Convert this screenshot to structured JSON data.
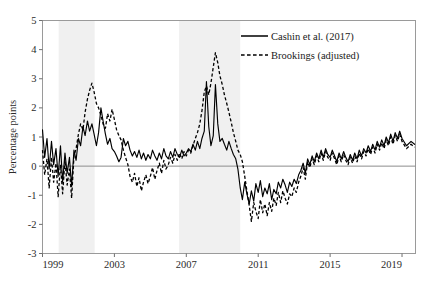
{
  "chart_data": {
    "type": "line",
    "title": "",
    "xlabel": "",
    "ylabel": "Percentage points",
    "xlim": [
      1999.0,
      2019.75
    ],
    "ylim": [
      -3,
      5
    ],
    "grid": false,
    "legend_position": "top-right",
    "y_ticks": [
      5,
      4,
      3,
      2,
      1,
      0,
      -1,
      -2,
      -3
    ],
    "y_tick_labels": [
      "5",
      "4",
      "3",
      "2",
      "1",
      "0",
      "-1",
      "-2",
      "-3"
    ],
    "x_ticks": [
      1999,
      2003,
      2007,
      2011,
      2015,
      2019
    ],
    "x_tick_labels": [
      "1999",
      "2003",
      "2007",
      "2011",
      "2015",
      "2019"
    ],
    "zero_line": 0,
    "shaded_regions": [
      {
        "label": "recession-band-2001",
        "start": 1999.9,
        "end": 2001.9
      },
      {
        "label": "recession-band-2008",
        "start": 2006.6,
        "end": 2010.0
      }
    ],
    "series": [
      {
        "name": "Cashin et al. (2017)",
        "style": "solid",
        "x": [
          1999.0,
          1999.12,
          1999.25,
          1999.37,
          1999.5,
          1999.62,
          1999.75,
          1999.87,
          2000.0,
          2000.12,
          2000.25,
          2000.37,
          2000.5,
          2000.62,
          2000.75,
          2000.87,
          2001.0,
          2001.12,
          2001.25,
          2001.37,
          2001.5,
          2001.62,
          2001.75,
          2001.87,
          2002.0,
          2002.12,
          2002.25,
          2002.37,
          2002.5,
          2002.62,
          2002.75,
          2002.87,
          2003.0,
          2003.12,
          2003.25,
          2003.37,
          2003.5,
          2003.62,
          2003.75,
          2003.87,
          2004.0,
          2004.12,
          2004.25,
          2004.37,
          2004.5,
          2004.62,
          2004.75,
          2004.87,
          2005.0,
          2005.12,
          2005.25,
          2005.37,
          2005.5,
          2005.62,
          2005.75,
          2005.87,
          2006.0,
          2006.12,
          2006.25,
          2006.37,
          2006.5,
          2006.62,
          2006.75,
          2006.87,
          2007.0,
          2007.12,
          2007.25,
          2007.37,
          2007.5,
          2007.62,
          2007.75,
          2007.87,
          2008.0,
          2008.12,
          2008.25,
          2008.37,
          2008.5,
          2008.62,
          2008.75,
          2008.87,
          2009.0,
          2009.12,
          2009.25,
          2009.37,
          2009.5,
          2009.62,
          2009.75,
          2009.87,
          2010.0,
          2010.12,
          2010.25,
          2010.37,
          2010.5,
          2010.62,
          2010.75,
          2010.87,
          2011.0,
          2011.12,
          2011.25,
          2011.37,
          2011.5,
          2011.62,
          2011.75,
          2011.87,
          2012.0,
          2012.12,
          2012.25,
          2012.37,
          2012.5,
          2012.62,
          2012.75,
          2012.87,
          2013.0,
          2013.12,
          2013.25,
          2013.37,
          2013.5,
          2013.62,
          2013.75,
          2013.87,
          2014.0,
          2014.12,
          2014.25,
          2014.37,
          2014.5,
          2014.62,
          2014.75,
          2014.87,
          2015.0,
          2015.12,
          2015.25,
          2015.37,
          2015.5,
          2015.62,
          2015.75,
          2015.87,
          2016.0,
          2016.12,
          2016.25,
          2016.37,
          2016.5,
          2016.62,
          2016.75,
          2016.87,
          2017.0,
          2017.12,
          2017.25,
          2017.37,
          2017.5,
          2017.62,
          2017.75,
          2017.87,
          2018.0,
          2018.12,
          2018.25,
          2018.37,
          2018.5,
          2018.62,
          2018.75,
          2018.87,
          2019.0,
          2019.25,
          2019.5,
          2019.7
        ],
        "y": [
          1.25,
          0.3,
          0.95,
          -0.1,
          0.85,
          0.05,
          0.6,
          -0.35,
          0.7,
          -0.55,
          0.45,
          -0.25,
          0.3,
          -0.7,
          0.55,
          0.2,
          0.95,
          0.7,
          1.35,
          1.05,
          1.55,
          1.2,
          1.45,
          1.1,
          0.7,
          1.15,
          2.0,
          1.55,
          1.1,
          0.75,
          0.95,
          0.6,
          0.5,
          0.35,
          0.15,
          0.3,
          0.95,
          0.7,
          0.85,
          0.55,
          0.35,
          0.5,
          0.3,
          0.55,
          0.25,
          0.45,
          0.2,
          0.4,
          0.25,
          0.55,
          0.35,
          0.2,
          0.45,
          0.25,
          0.6,
          0.35,
          0.25,
          0.5,
          0.3,
          0.6,
          0.4,
          0.3,
          0.55,
          0.35,
          0.45,
          0.6,
          0.5,
          0.75,
          0.55,
          0.85,
          0.6,
          0.95,
          1.2,
          2.9,
          1.35,
          0.7,
          1.05,
          2.8,
          1.45,
          0.85,
          0.95,
          0.75,
          0.55,
          0.85,
          0.6,
          0.4,
          0.25,
          -0.1,
          -0.75,
          -1.15,
          -0.55,
          -0.95,
          -1.3,
          -0.85,
          -1.2,
          -0.6,
          -0.9,
          -0.5,
          -1.05,
          -0.75,
          -0.95,
          -0.6,
          -1.15,
          -0.8,
          -0.95,
          -0.55,
          -0.75,
          -0.45,
          -0.65,
          -0.9,
          -0.55,
          -0.7,
          -0.45,
          -0.6,
          -0.3,
          -0.15,
          0.1,
          -0.25,
          0.25,
          0.05,
          0.35,
          0.15,
          0.45,
          0.25,
          0.55,
          0.3,
          0.6,
          0.4,
          0.3,
          0.55,
          0.35,
          0.15,
          0.45,
          0.25,
          0.5,
          0.3,
          0.15,
          0.4,
          0.2,
          0.45,
          0.25,
          0.55,
          0.35,
          0.6,
          0.45,
          0.7,
          0.5,
          0.75,
          0.55,
          0.85,
          0.65,
          0.9,
          0.7,
          1.0,
          0.8,
          1.1,
          0.85,
          1.15,
          0.95,
          1.2,
          0.95,
          0.7,
          0.85,
          0.75
        ]
      },
      {
        "name": "Brookings (adjusted)",
        "style": "dashed",
        "x": [
          1999.0,
          1999.12,
          1999.25,
          1999.37,
          1999.5,
          1999.62,
          1999.75,
          1999.87,
          2000.0,
          2000.12,
          2000.25,
          2000.37,
          2000.5,
          2000.62,
          2000.75,
          2000.87,
          2001.0,
          2001.12,
          2001.25,
          2001.37,
          2001.5,
          2001.62,
          2001.75,
          2001.87,
          2002.0,
          2002.12,
          2002.25,
          2002.37,
          2002.5,
          2002.62,
          2002.75,
          2002.87,
          2003.0,
          2003.12,
          2003.25,
          2003.37,
          2003.5,
          2003.62,
          2003.75,
          2003.87,
          2004.0,
          2004.12,
          2004.25,
          2004.37,
          2004.5,
          2004.62,
          2004.75,
          2004.87,
          2005.0,
          2005.12,
          2005.25,
          2005.37,
          2005.5,
          2005.62,
          2005.75,
          2005.87,
          2006.0,
          2006.12,
          2006.25,
          2006.37,
          2006.5,
          2006.62,
          2006.75,
          2006.87,
          2007.0,
          2007.12,
          2007.25,
          2007.37,
          2007.5,
          2007.62,
          2007.75,
          2007.87,
          2008.0,
          2008.12,
          2008.25,
          2008.37,
          2008.5,
          2008.62,
          2008.75,
          2008.87,
          2009.0,
          2009.12,
          2009.25,
          2009.37,
          2009.5,
          2009.62,
          2009.75,
          2009.87,
          2010.0,
          2010.12,
          2010.25,
          2010.37,
          2010.5,
          2010.62,
          2010.75,
          2010.87,
          2011.0,
          2011.12,
          2011.25,
          2011.37,
          2011.5,
          2011.62,
          2011.75,
          2011.87,
          2012.0,
          2012.12,
          2012.25,
          2012.37,
          2012.5,
          2012.62,
          2012.75,
          2012.87,
          2013.0,
          2013.12,
          2013.25,
          2013.37,
          2013.5,
          2013.62,
          2013.75,
          2013.87,
          2014.0,
          2014.12,
          2014.25,
          2014.37,
          2014.5,
          2014.62,
          2014.75,
          2014.87,
          2015.0,
          2015.12,
          2015.25,
          2015.37,
          2015.5,
          2015.62,
          2015.75,
          2015.87,
          2016.0,
          2016.12,
          2016.25,
          2016.37,
          2016.5,
          2016.62,
          2016.75,
          2016.87,
          2017.0,
          2017.12,
          2017.25,
          2017.37,
          2017.5,
          2017.62,
          2017.75,
          2017.87,
          2018.0,
          2018.12,
          2018.25,
          2018.37,
          2018.5,
          2018.62,
          2018.75,
          2018.87,
          2019.0,
          2019.25,
          2019.5,
          2019.7
        ],
        "y": [
          0.55,
          -0.3,
          0.25,
          -0.75,
          0.3,
          -0.55,
          0.1,
          -1.05,
          0.05,
          -0.95,
          0.2,
          -0.65,
          -0.1,
          -1.1,
          0.35,
          0.6,
          1.1,
          1.45,
          1.25,
          1.85,
          2.3,
          2.6,
          2.85,
          2.55,
          2.15,
          2.0,
          1.75,
          1.45,
          1.3,
          1.8,
          1.55,
          1.95,
          1.6,
          1.25,
          1.05,
          0.9,
          0.55,
          0.3,
          0.05,
          -0.35,
          -0.55,
          -0.25,
          -0.7,
          -0.4,
          -0.85,
          -0.55,
          -0.3,
          -0.6,
          -0.35,
          -0.05,
          -0.45,
          -0.15,
          0.1,
          -0.25,
          0.2,
          -0.1,
          0.05,
          0.3,
          0.1,
          0.4,
          0.2,
          0.45,
          0.25,
          0.5,
          0.35,
          0.55,
          0.45,
          0.7,
          0.95,
          1.15,
          1.45,
          1.9,
          2.55,
          2.75,
          2.45,
          2.85,
          3.4,
          3.9,
          3.55,
          3.1,
          2.8,
          2.45,
          2.15,
          1.85,
          1.5,
          1.15,
          0.85,
          0.55,
          0.4,
          0.15,
          -0.35,
          -0.85,
          -1.35,
          -1.9,
          -1.25,
          -1.55,
          -1.8,
          -1.15,
          -1.6,
          -1.3,
          -1.7,
          -1.25,
          -1.55,
          -1.1,
          -1.35,
          -0.9,
          -1.25,
          -0.85,
          -1.1,
          -1.3,
          -0.95,
          -1.05,
          -0.75,
          -0.9,
          -0.55,
          -0.35,
          -0.05,
          -0.45,
          0.15,
          -0.05,
          0.25,
          0.05,
          0.35,
          0.15,
          0.45,
          0.2,
          0.5,
          0.3,
          0.2,
          0.45,
          0.25,
          0.05,
          0.35,
          0.15,
          0.4,
          0.2,
          0.05,
          0.3,
          0.1,
          0.35,
          0.15,
          0.45,
          0.25,
          0.5,
          0.35,
          0.6,
          0.4,
          0.65,
          0.45,
          0.75,
          0.55,
          0.8,
          0.6,
          0.9,
          0.7,
          1.0,
          0.75,
          1.05,
          0.85,
          1.1,
          0.85,
          0.6,
          0.75,
          0.65
        ]
      }
    ]
  },
  "legend": {
    "items": [
      {
        "label": "Cashin et al. (2017)",
        "style": "solid"
      },
      {
        "label": "Brookings (adjusted)",
        "style": "dashed"
      }
    ]
  }
}
